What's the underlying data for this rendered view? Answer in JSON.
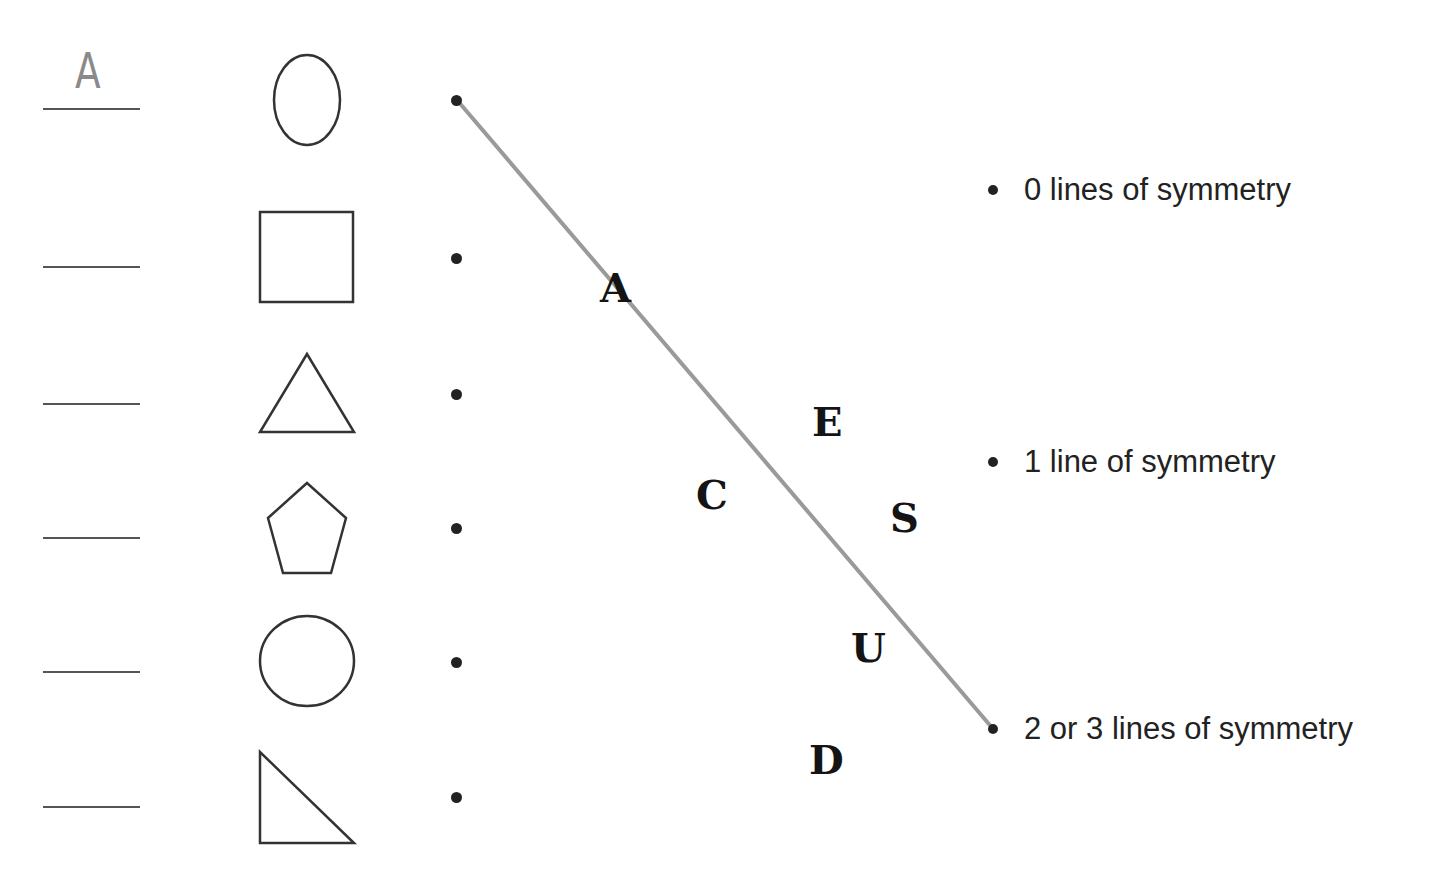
{
  "worksheet": {
    "rows": [
      {
        "shape": "oval",
        "answer": "A"
      },
      {
        "shape": "square",
        "answer": ""
      },
      {
        "shape": "equilateral-triangle",
        "answer": ""
      },
      {
        "shape": "pentagon",
        "answer": ""
      },
      {
        "shape": "circle",
        "answer": ""
      },
      {
        "shape": "right-triangle",
        "answer": ""
      }
    ],
    "categories": [
      {
        "label": "0 lines of symmetry"
      },
      {
        "label": "1 line of symmetry"
      },
      {
        "label": "2 or 3 lines of symmetry"
      }
    ],
    "scattered_letters": [
      "A",
      "E",
      "C",
      "S",
      "U",
      "D"
    ],
    "connection": {
      "from_row": 0,
      "to_category": 2,
      "color": "#9a9a9a"
    }
  },
  "colors": {
    "ink": "#222222",
    "shape_stroke": "#333333",
    "answer_line": "#555555",
    "handwriting": "#8a8a8a",
    "connector": "#9a9a9a"
  }
}
